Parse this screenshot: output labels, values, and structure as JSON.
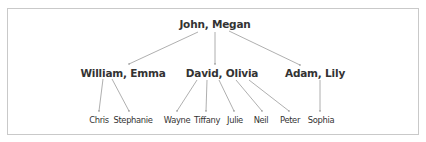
{
  "diagram": {
    "type": "family-tree",
    "colors": {
      "text": "#333333",
      "line": "#9a9a9a",
      "border": "#c9c9c9"
    },
    "nodes": {
      "root": {
        "label": "John, Megan",
        "x": 215,
        "y": 18
      },
      "gen1": [
        {
          "id": "william_emma",
          "label": "William, Emma",
          "x": 123,
          "y": 67
        },
        {
          "id": "david_olivia",
          "label": "David, Olivia",
          "x": 222,
          "y": 67
        },
        {
          "id": "adam_lily",
          "label": "Adam, Lily",
          "x": 315,
          "y": 67
        }
      ],
      "gen2": [
        {
          "id": "chris",
          "label": "Chris",
          "parent": "william_emma",
          "x": 99,
          "y": 114
        },
        {
          "id": "stephanie",
          "label": "Stephanie",
          "parent": "william_emma",
          "x": 133,
          "y": 114
        },
        {
          "id": "wayne",
          "label": "Wayne",
          "parent": "david_olivia",
          "x": 177,
          "y": 114
        },
        {
          "id": "tiffany",
          "label": "Tiffany",
          "parent": "david_olivia",
          "x": 207,
          "y": 114
        },
        {
          "id": "julie",
          "label": "Julie",
          "parent": "david_olivia",
          "x": 235,
          "y": 114
        },
        {
          "id": "neil",
          "label": "Neil",
          "parent": "david_olivia",
          "x": 261,
          "y": 114
        },
        {
          "id": "peter",
          "label": "Peter",
          "parent": "david_olivia",
          "x": 290,
          "y": 114
        },
        {
          "id": "sophia",
          "label": "Sophia",
          "parent": "adam_lily",
          "x": 321,
          "y": 114
        }
      ]
    },
    "edges": [
      {
        "from": "John, Megan",
        "to": "William, Emma",
        "x1": 198,
        "y1": 32,
        "x2": 129,
        "y2": 64
      },
      {
        "from": "John, Megan",
        "to": "David, Olivia",
        "x1": 215,
        "y1": 32,
        "x2": 215,
        "y2": 64
      },
      {
        "from": "John, Megan",
        "to": "Adam, Lily",
        "x1": 229,
        "y1": 31,
        "x2": 300,
        "y2": 65
      },
      {
        "from": "William, Emma",
        "to": "Chris",
        "x1": 103,
        "y1": 79,
        "x2": 99,
        "y2": 111
      },
      {
        "from": "William, Emma",
        "to": "Stephanie",
        "x1": 112,
        "y1": 79,
        "x2": 129,
        "y2": 111
      },
      {
        "from": "David, Olivia",
        "to": "Wayne",
        "x1": 197,
        "y1": 80,
        "x2": 177,
        "y2": 111
      },
      {
        "from": "David, Olivia",
        "to": "Tiffany",
        "x1": 207,
        "y1": 80,
        "x2": 206,
        "y2": 111
      },
      {
        "from": "David, Olivia",
        "to": "Julie",
        "x1": 219,
        "y1": 80,
        "x2": 234,
        "y2": 111
      },
      {
        "from": "David, Olivia",
        "to": "Neil",
        "x1": 236,
        "y1": 80,
        "x2": 262,
        "y2": 111
      },
      {
        "from": "David, Olivia",
        "to": "Peter",
        "x1": 249,
        "y1": 80,
        "x2": 289,
        "y2": 111
      },
      {
        "from": "Adam, Lily",
        "to": "Sophia",
        "x1": 320,
        "y1": 80,
        "x2": 320,
        "y2": 111
      }
    ]
  }
}
